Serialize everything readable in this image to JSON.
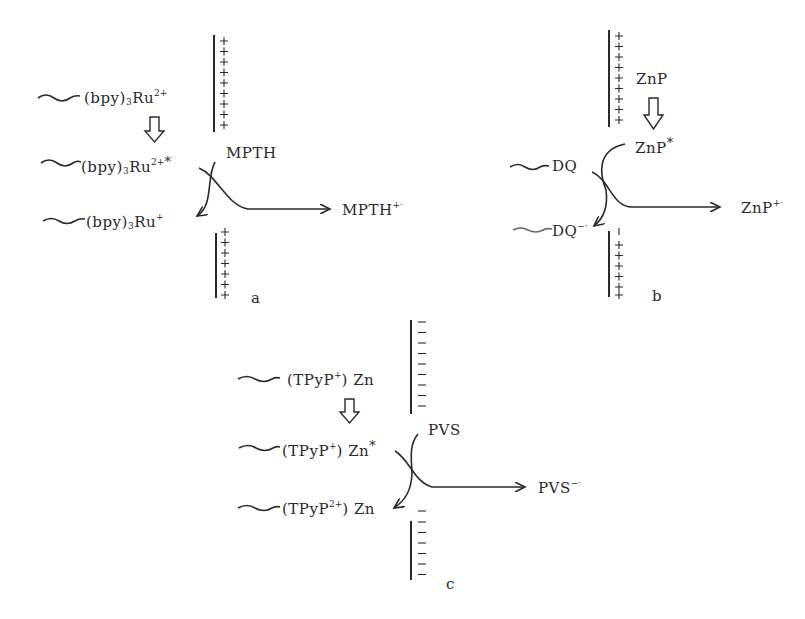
{
  "figure": {
    "panels": [
      {
        "id": "a",
        "label": "a",
        "membrane_charge": "+",
        "species": {
          "ground": {
            "base": "(bpy)",
            "sub": "3",
            "metal": "Ru",
            "sup": "2+"
          },
          "excited": {
            "base": "(bpy)",
            "sub": "3",
            "metal": "Ru",
            "sup": "2+",
            "mark": "*"
          },
          "reduced": {
            "base": "(bpy)",
            "sub": "3",
            "metal": "Ru",
            "sup": "+"
          }
        },
        "donor": "MPTH",
        "product": {
          "name": "MPTH",
          "sup": "+·"
        }
      },
      {
        "id": "b",
        "label": "b",
        "membrane_charge": "+",
        "species": {
          "ground": "ZnP",
          "excited": {
            "name": "ZnP",
            "mark": "*"
          },
          "acceptor": "DQ",
          "acceptor_reduced": {
            "name": "DQ",
            "sup": "−·"
          }
        },
        "product": {
          "name": "ZnP",
          "sup": "+·"
        }
      },
      {
        "id": "c",
        "label": "c",
        "membrane_charge": "−",
        "species": {
          "ground": {
            "open": "(TPyP",
            "sup": "+",
            "close": ") Zn"
          },
          "excited": {
            "open": "(TPyP",
            "sup": "+",
            "close": ") Zn",
            "mark": "*"
          },
          "oxidized": {
            "open": "(TPyP",
            "sup": "2+",
            "close": ") Zn"
          }
        },
        "acceptor": "PVS",
        "product": {
          "name": "PVS",
          "sup": "−·"
        }
      }
    ],
    "icons": {
      "wavy_chain": "wavy-chain-icon",
      "hollow_arrow": "hollow-down-arrow-icon",
      "curved_arrow": "curved-electron-transfer-arrow-icon",
      "straight_arrow": "right-arrow-icon"
    }
  }
}
